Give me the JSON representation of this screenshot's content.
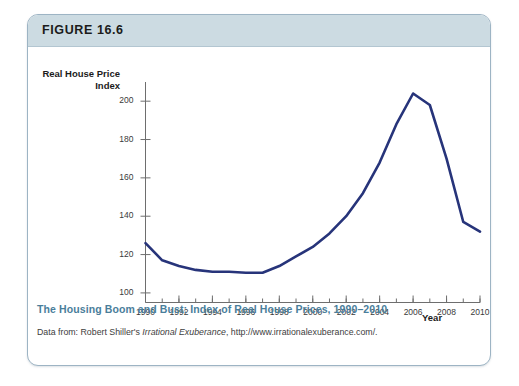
{
  "figure": {
    "label": "FIGURE 16.6",
    "caption_title": "The Housing Boom and Bust: Index of Real House Prices, 1990–2010",
    "source_prefix": "Data from: Robert Shiller's ",
    "source_italic": "Irrational Exuberance",
    "source_suffix": ", http://www.irrationalexuberance.com/."
  },
  "colors": {
    "line": "#27347a",
    "header_band": "#ccdbe2",
    "card_border": "#9db4c4",
    "caption_title": "#4a7e9b",
    "axis": "#6e6e6e"
  },
  "chart_data": {
    "type": "line",
    "title": "The Housing Boom and Bust: Index of Real House Prices, 1990–2010",
    "xlabel": "Year",
    "ylabel": "Real House Price Index",
    "xlim": [
      1990,
      2010
    ],
    "ylim": [
      95,
      210
    ],
    "grid": false,
    "legend": null,
    "xticks": [
      1990,
      1992,
      1994,
      1996,
      1998,
      2000,
      2002,
      2004,
      2006,
      2008,
      2010
    ],
    "xtick_labels": [
      "1990",
      "1992",
      "1994",
      "1996",
      "1998",
      "2000",
      "2002",
      "2004",
      "2006",
      "2008",
      "2010"
    ],
    "xminor_step": 1,
    "yticks": [
      100,
      120,
      140,
      160,
      180,
      200
    ],
    "ytick_labels": [
      "100",
      "120",
      "140",
      "160",
      "180",
      "200"
    ],
    "series": [
      {
        "name": "Real House Price Index",
        "color": "#27347a",
        "x": [
          1990,
          1991,
          1992,
          1993,
          1994,
          1995,
          1996,
          1997,
          1998,
          1999,
          2000,
          2001,
          2002,
          2003,
          2004,
          2005,
          2006,
          2007,
          2008,
          2009,
          2010
        ],
        "values": [
          126,
          117,
          114,
          112,
          111,
          111,
          110.5,
          110.5,
          114,
          119,
          124,
          131,
          140,
          152,
          168,
          188,
          204,
          198,
          170,
          137,
          132
        ]
      }
    ]
  }
}
